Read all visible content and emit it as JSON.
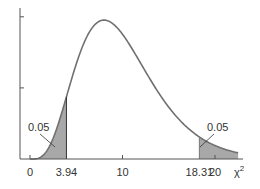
{
  "chart_data": {
    "type": "area",
    "title": "",
    "distribution": "chi-square",
    "xlabel": "χ²",
    "ylabel": "",
    "xlim": [
      0,
      22.5
    ],
    "ylim": [
      0,
      0.105
    ],
    "grid": false,
    "x_ticks": [
      {
        "value": 0,
        "label": "0"
      },
      {
        "value": 3.94,
        "label": "3.94"
      },
      {
        "value": 10,
        "label": "10"
      },
      {
        "value": 18.31,
        "label": "18.31"
      },
      {
        "value": 20,
        "label": "20"
      }
    ],
    "y_ticks": [
      0.05,
      0.1
    ],
    "curve": {
      "x": [
        0,
        1,
        2,
        3,
        3.94,
        5,
        6,
        7,
        8,
        9,
        10,
        11,
        12,
        13,
        14,
        15,
        16,
        17,
        18,
        18.31,
        19,
        20,
        21,
        22,
        22.5
      ],
      "y": [
        0,
        0.00079,
        0.00766,
        0.0235,
        0.0451,
        0.0668,
        0.084,
        0.0943,
        0.0977,
        0.0949,
        0.0877,
        0.0778,
        0.067,
        0.0559,
        0.0457,
        0.0365,
        0.0286,
        0.0221,
        0.0167,
        0.0153,
        0.0124,
        0.00916,
        0.00665,
        0.00478,
        0.00404
      ]
    },
    "shaded_regions": [
      {
        "from": 0,
        "to": 3.94,
        "area_label": "0.05"
      },
      {
        "from": 18.31,
        "to": 22.5,
        "area_label": "0.05"
      }
    ],
    "annotations": [
      {
        "text": "0.05",
        "points_to": "left tail"
      },
      {
        "text": "0.05",
        "points_to": "right tail"
      }
    ],
    "colors": {
      "curve": "#707070",
      "shade": "#a8a8a8",
      "axis": "#555555",
      "text": "#333333"
    }
  }
}
